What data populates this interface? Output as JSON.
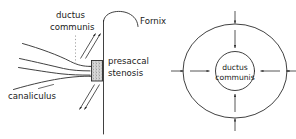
{
  "figure": {
    "title": "",
    "background_color": "#ffffff",
    "stroke_color": "#2b2b2b",
    "text_color": "#1a1a1a",
    "width": 296,
    "height": 139
  },
  "left_panel": {
    "name": "sagittal-lacrimal-drainage-diagram",
    "labels": {
      "ductus_communis_line1": "ductus",
      "ductus_communis_line2": "communis",
      "fornix": "Fornix",
      "presaccal_line1": "presaccal",
      "presaccal_line2": "stenosis",
      "canaliculus": "canaliculus"
    },
    "features": {
      "stenosis_fill": "stippled",
      "leader_style": "dotted",
      "wall_orientation": "vertical",
      "arrow_count": 4
    }
  },
  "right_panel": {
    "name": "cross-section-compression-diagram",
    "labels": {
      "ductus_communis_line1": "ductus",
      "ductus_communis_line2": "communis"
    },
    "features": {
      "outer_shape": "ellipse",
      "inner_shape": "circle",
      "arrow_directions": [
        "left",
        "right",
        "up",
        "down"
      ],
      "arrow_count": 8,
      "arrow_meaning": "inward-compression"
    }
  }
}
